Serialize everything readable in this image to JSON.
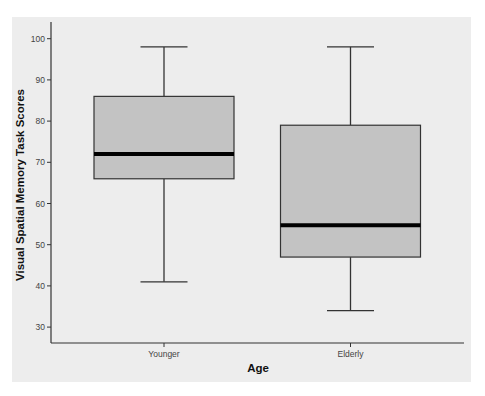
{
  "chart_data": {
    "type": "boxplot",
    "title": "",
    "xlabel": "Age",
    "ylabel": "Visual Spatial Memory Task Scores",
    "categories": [
      "Younger",
      "Elderly"
    ],
    "series": [
      {
        "name": "Younger",
        "min": 41,
        "q1": 66,
        "median": 72,
        "q3": 86,
        "max": 98
      },
      {
        "name": "Elderly",
        "min": 34,
        "q1": 47,
        "median": 54.7,
        "q3": 79,
        "max": 98
      }
    ],
    "ylim": [
      26,
      102
    ],
    "yticks": [
      30,
      40,
      50,
      60,
      70,
      80,
      90,
      100
    ],
    "grid": false,
    "legend": null
  },
  "colors": {
    "page_background": "#ffffff",
    "plot_background": "#ededed",
    "box_fill": "#c3c3c3",
    "box_stroke": "#333333",
    "median": "#000000",
    "axis": "#333333"
  }
}
